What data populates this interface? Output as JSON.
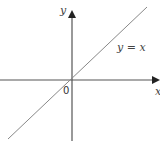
{
  "diagram": {
    "axis_labels": {
      "x": "x",
      "y": "y"
    },
    "origin_label": "0",
    "line_label": "y = x",
    "colors": {
      "axis": "#555555",
      "line": "#888888",
      "text": "#444444"
    }
  }
}
